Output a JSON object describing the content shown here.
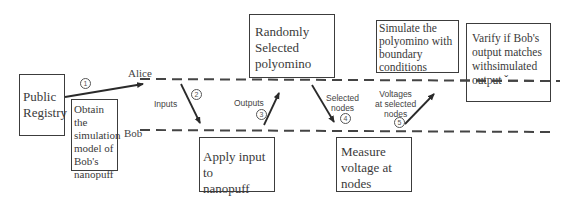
{
  "lanes": {
    "alice_label": "Alice",
    "bob_label": "Bob"
  },
  "boxes": {
    "public_registry": [
      "Public",
      "Registry"
    ],
    "obtain_model": [
      "Obtain the",
      "simulation",
      "model of",
      "Bob's",
      "nanopuff"
    ],
    "random_polyomino": [
      "Randomly",
      "Selected",
      "polyomino"
    ],
    "apply_input": [
      "Apply input to",
      "nanopuff"
    ],
    "measure_voltage": [
      "Measure",
      "voltage at",
      "nodes"
    ],
    "simulate_polyomino": [
      "Simulate the",
      "polyomino with",
      "boundary",
      "conditions"
    ],
    "verify_output": [
      "Varify if Bob's",
      "output matches",
      "withsimulated",
      "output  ˇ"
    ]
  },
  "steps": [
    {
      "number": "1",
      "label": ""
    },
    {
      "number": "2",
      "label": "Inputs"
    },
    {
      "number": "3",
      "label": "Outputs"
    },
    {
      "number": "4",
      "label": [
        "Selected",
        "nodes"
      ]
    },
    {
      "number": "5",
      "label": [
        "Voltages",
        "at selected",
        "nodes"
      ]
    }
  ]
}
